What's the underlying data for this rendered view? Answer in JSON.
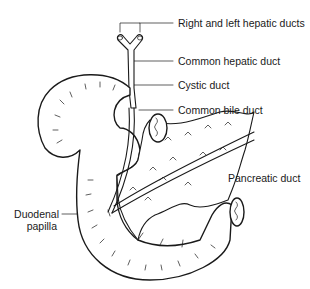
{
  "diagram": {
    "type": "anatomical-illustration",
    "labels": [
      {
        "id": "right-left-hepatic-ducts",
        "text": "Right and left hepatic ducts"
      },
      {
        "id": "common-hepatic-duct",
        "text": "Common hepatic duct"
      },
      {
        "id": "cystic-duct",
        "text": "Cystic duct"
      },
      {
        "id": "common-bile-duct",
        "text": "Common bile duct"
      },
      {
        "id": "pancreatic-duct",
        "text": "Pancreatic duct"
      },
      {
        "id": "duodenal-papilla-line1",
        "text": "Duodenal"
      },
      {
        "id": "duodenal-papilla-line2",
        "text": "papilla"
      }
    ],
    "colors": {
      "line": "#1a1a1a",
      "background": "#ffffff"
    }
  }
}
